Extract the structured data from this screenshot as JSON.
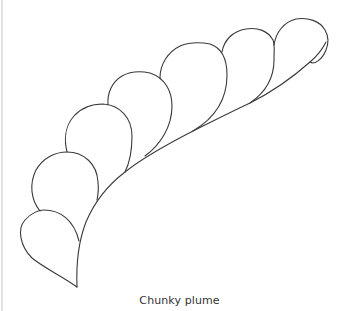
{
  "figure": {
    "caption": "Chunky plume",
    "stroke_color": "#3a3a3a",
    "background_color": "#ffffff",
    "leaf_count": 7
  }
}
